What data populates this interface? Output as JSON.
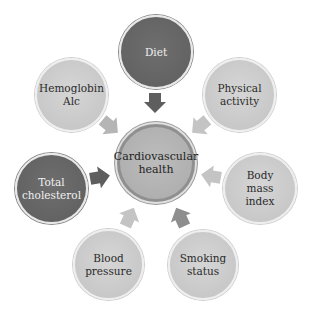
{
  "diagram": {
    "center": {
      "label": "Cardiovascular health",
      "line1": "Cardiovascular",
      "line2": "health"
    },
    "nodes": [
      {
        "id": "diet",
        "line1": "Diet",
        "line2": "",
        "shade": "dark"
      },
      {
        "id": "physical-activity",
        "line1": "Physical",
        "line2": "activity",
        "shade": "light"
      },
      {
        "id": "body-mass-index",
        "line1": "Body mass",
        "line2": "index",
        "shade": "light"
      },
      {
        "id": "smoking-status",
        "line1": "Smoking",
        "line2": "status",
        "shade": "light"
      },
      {
        "id": "blood-pressure",
        "line1": "Blood",
        "line2": "pressure",
        "shade": "light"
      },
      {
        "id": "total-cholesterol",
        "line1": "Total",
        "line2": "cholesterol",
        "shade": "dark"
      },
      {
        "id": "hemoglobin-a1c",
        "line1": "Hemoglobin",
        "line2": "Alc",
        "shade": "light"
      }
    ],
    "colors": {
      "dark_node": "#636363",
      "light_node": "#c8c8c8",
      "center_node": "#b0b0b0",
      "dark_arrow": "#5e5e5e",
      "light_arrow": "#bdbdbd",
      "mid_arrow": "#9a9a9a"
    }
  }
}
